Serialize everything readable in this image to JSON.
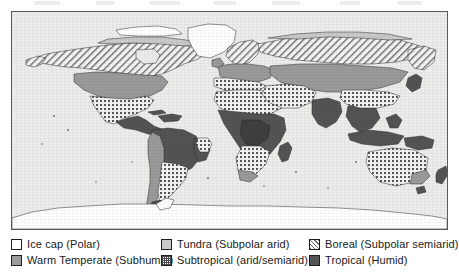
{
  "map": {
    "title": "World climate zones",
    "frame": {
      "border_color": "#5a5a5a",
      "ocean_color": "#ececea"
    },
    "regions_depicted": [
      "North America",
      "Greenland",
      "South America",
      "Europe",
      "Africa",
      "Asia",
      "Australia",
      "Antarctica"
    ]
  },
  "legend": {
    "rows": [
      {
        "items": [
          {
            "swatch": "ice-cap-swatch",
            "pattern": "solid-white",
            "color": "#ffffff",
            "label": "Ice cap (Polar)"
          },
          {
            "swatch": "tundra-swatch",
            "pattern": "solid-light",
            "color": "#c9c9c9",
            "label": "Tundra (Subpolar arid)"
          },
          {
            "swatch": "boreal-swatch",
            "pattern": "diagonal-hatch",
            "color": "#6e6e6e",
            "label": "Boreal (Subpolar semiarid)"
          }
        ]
      },
      {
        "items": [
          {
            "swatch": "warm-temperate-swatch",
            "pattern": "solid-medium",
            "color": "#9a9a9a",
            "label": "Warm Temperate (Subhumid)"
          },
          {
            "swatch": "subtropical-swatch",
            "pattern": "dotted-grid",
            "color": "#4a4a4a",
            "label": "Subtropical (arid/semiarid)"
          },
          {
            "swatch": "tropical-swatch",
            "pattern": "solid-dark",
            "color": "#545454",
            "label": "Tropical (Humid)"
          }
        ]
      }
    ]
  }
}
